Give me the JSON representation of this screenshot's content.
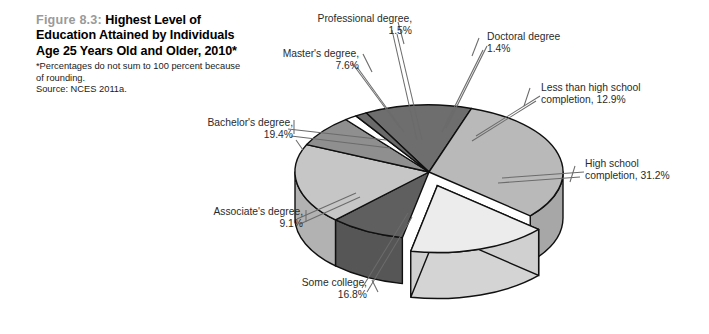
{
  "figure": {
    "number": "Figure 8.3:",
    "title": "Highest\nLevel of Education Attained\nby Individuals Age 25 Years\nOld and Older, 2010*",
    "note": "*Percentages do not sum to\n100 percent because of rounding.",
    "source": "Source: NCES 2011a."
  },
  "labels": {
    "professional": "Professional degree,\n1.5%",
    "masters": "Master's degree,\n7.6%",
    "bachelors": "Bachelor's degree,\n19.4%",
    "associates": "Associate's degree,\n9.1%",
    "some_college": "Some college,\n16.8%",
    "doctoral": "Doctoral degree\n1.4%",
    "less_than_hs": "Less than high school\ncompletion, 12.9%",
    "high_school": "High school\ncompletion, 31.2%"
  },
  "colors": {
    "less_than_hs": "#6e6e6e",
    "high_school": "#b9b9b9",
    "some_college": "#ececec",
    "associates": "#5f5f5f",
    "bachelors": "#c6c6c6",
    "masters": "#8f8f8f",
    "professional": "#ffffff",
    "doctoral": "#6a6a6a",
    "outline": "#101010",
    "leader": "#6b6b6b",
    "figure_number": "#9a9a9a",
    "background": "#ffffff"
  },
  "chart_data": {
    "type": "pie",
    "title": "Highest Level of Education Attained by Individuals Age 25 Years Old and Older, 2010",
    "subtitle": "*Percentages do not sum to 100 percent because of rounding.",
    "source": "Source: NCES 2011a.",
    "ylabel": "",
    "xlabel": "",
    "units": "percent",
    "three_d": true,
    "exploded_slice": "Some college",
    "legend_position": "callout-labels",
    "categories": [
      "Less than high school completion",
      "High school completion",
      "Some college",
      "Associate's degree",
      "Bachelor's degree",
      "Master's degree",
      "Professional degree",
      "Doctoral degree"
    ],
    "values": [
      12.9,
      31.2,
      16.8,
      9.1,
      19.4,
      7.6,
      1.5,
      1.4
    ],
    "value_labels": [
      "12.9%",
      "31.2%",
      "16.8%",
      "9.1%",
      "19.4%",
      "7.6%",
      "1.5%",
      "1.4%"
    ],
    "total": 99.9,
    "slice_colors": [
      "#6e6e6e",
      "#b9b9b9",
      "#ececec",
      "#5f5f5f",
      "#c6c6c6",
      "#8f8f8f",
      "#ffffff",
      "#6a6a6a"
    ]
  }
}
